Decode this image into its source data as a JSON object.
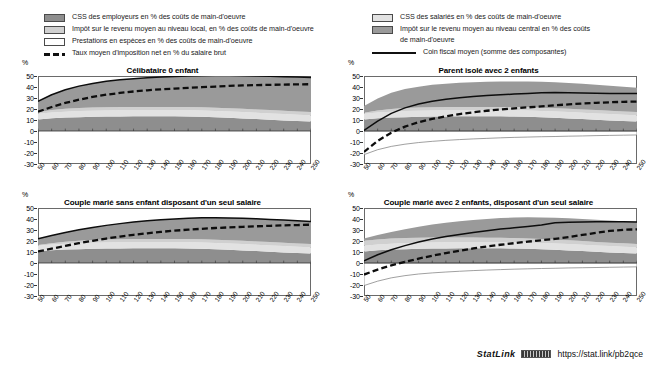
{
  "legend": {
    "left_items": [
      {
        "icon": "swatch-dark-gray",
        "label": "CSS des employeurs en % des coûts de main-d'oeuvre",
        "color": "#8e8e8e"
      },
      {
        "icon": "swatch-light-gray",
        "label": "Impôt sur le revenu moyen au niveau local, en % des coûts de main-d'oeuvre",
        "color": "#d0d0d0"
      },
      {
        "icon": "swatch-white",
        "label": "Prestations en espèces en % des coûts de main-d'oeuvre",
        "color": "#ffffff"
      },
      {
        "icon": "dashed-line-sample",
        "label": "Taux moyen d'imposition net en % du salaire brut",
        "color": "#101010"
      }
    ],
    "right_items": [
      {
        "icon": "swatch-pale-gray",
        "label": "CSS des salariés en % des coûts de main-d'oeuvre",
        "color": "#e2e2e2"
      },
      {
        "icon": "swatch-mid-gray",
        "label": "Impôt sur le revenu moyen au niveau central en %  des coûts",
        "label2": "de main-d'oeuvre",
        "color": "#9a9a9a"
      },
      {
        "icon": "solid-line-sample",
        "label": "Coin fiscal moyen (somme des composantes)",
        "color": "#101010"
      }
    ]
  },
  "axis": {
    "y_unit": "%",
    "y_ticks": [
      "50",
      "40",
      "30",
      "20",
      "10",
      "0",
      "-10",
      "-20",
      "-30"
    ],
    "x_ticks": [
      "50",
      "60",
      "70",
      "80",
      "90",
      "100",
      "110",
      "120",
      "130",
      "140",
      "150",
      "160",
      "170",
      "180",
      "190",
      "200",
      "210",
      "220",
      "230",
      "240",
      "250"
    ]
  },
  "footer": {
    "statlink_word": "StatLink",
    "statlink_url": "https://stat.link/pb2qce"
  },
  "chart_data": [
    {
      "id": "celibataire-0-enfant",
      "type": "area",
      "title": "Célibataire 0 enfant",
      "xlabel": "",
      "ylabel": "%",
      "xlim": [
        50,
        250
      ],
      "ylim": [
        -30,
        50
      ],
      "grid": false,
      "legend_position": "top",
      "x": [
        50,
        60,
        70,
        80,
        90,
        100,
        110,
        120,
        130,
        140,
        150,
        160,
        170,
        180,
        190,
        200,
        210,
        220,
        230,
        240,
        250
      ],
      "series": [
        {
          "name": "CSS des employeurs en % des coûts de main-d'oeuvre",
          "values": [
            10.5,
            11.5,
            12.2,
            12.6,
            12.9,
            13.1,
            13.2,
            13.3,
            13.3,
            13.3,
            13.3,
            13.2,
            13.0,
            12.6,
            12.0,
            11.4,
            10.8,
            10.2,
            9.6,
            9.1,
            8.7
          ]
        },
        {
          "name": "CSS des salariés en % des coûts de main-d'oeuvre",
          "values": [
            5.2,
            5.3,
            5.4,
            5.5,
            5.5,
            5.6,
            5.6,
            5.6,
            5.6,
            5.6,
            5.6,
            5.6,
            5.6,
            5.6,
            5.7,
            5.8,
            5.8,
            5.8,
            5.8,
            5.7,
            5.6
          ]
        },
        {
          "name": "Impôt sur le revenu moyen au niveau local, en % des coûts de main-d'oeuvre",
          "values": [
            1.4,
            2.2,
            2.6,
            2.8,
            2.9,
            3.0,
            3.0,
            3.0,
            3.0,
            3.0,
            3.0,
            3.0,
            3.0,
            3.0,
            3.0,
            3.0,
            3.0,
            3.0,
            3.0,
            3.0,
            3.0
          ]
        },
        {
          "name": "Impôt sur le revenu moyen au niveau central en % des coûts de main-d'oeuvre",
          "values": [
            9.9,
            14.0,
            17.3,
            19.9,
            21.9,
            23.5,
            24.7,
            25.7,
            26.5,
            27.2,
            27.7,
            28.2,
            28.7,
            29.3,
            29.8,
            30.1,
            30.4,
            30.7,
            31.0,
            31.2,
            31.4
          ]
        },
        {
          "name": "Prestations en espèces en % des coûts de main-d'oeuvre",
          "values": [
            0,
            0,
            0,
            0,
            0,
            0,
            0,
            0,
            0,
            0,
            0,
            0,
            0,
            0,
            0,
            0,
            0,
            0,
            0,
            0,
            0
          ]
        }
      ],
      "lines": [
        {
          "name": "Coin fiscal moyen (somme des composantes)",
          "style": "solid",
          "values": [
            27.0,
            33.0,
            37.5,
            40.8,
            43.2,
            45.2,
            46.5,
            47.6,
            48.4,
            49.1,
            49.6,
            50.0,
            50.3,
            50.5,
            50.5,
            50.3,
            50.0,
            49.7,
            49.4,
            49.0,
            48.7
          ]
        },
        {
          "name": "Taux moyen d'imposition net en % du salaire brut",
          "style": "dashed",
          "values": [
            17.5,
            21.8,
            25.5,
            28.5,
            31.0,
            33.0,
            34.6,
            35.9,
            37.0,
            37.9,
            38.6,
            39.2,
            39.8,
            40.4,
            41.0,
            41.4,
            41.7,
            42.0,
            42.2,
            42.4,
            42.5
          ]
        }
      ]
    },
    {
      "id": "parent-isole-2-enfants",
      "type": "area",
      "title": "Parent isolé avec 2 enfants",
      "xlabel": "",
      "ylabel": "%",
      "xlim": [
        50,
        250
      ],
      "ylim": [
        -30,
        50
      ],
      "grid": false,
      "legend_position": "top",
      "x": [
        50,
        60,
        70,
        80,
        90,
        100,
        110,
        120,
        130,
        140,
        150,
        160,
        170,
        180,
        190,
        200,
        210,
        220,
        230,
        240,
        250
      ],
      "series": [
        {
          "name": "CSS des employeurs en % des coûts de main-d'oeuvre",
          "values": [
            10.5,
            11.5,
            12.2,
            12.6,
            12.9,
            13.1,
            13.2,
            13.3,
            13.3,
            13.3,
            13.3,
            13.2,
            13.0,
            12.6,
            12.0,
            11.4,
            10.8,
            10.2,
            9.6,
            9.1,
            8.7
          ]
        },
        {
          "name": "CSS des salariés en % des coûts de main-d'oeuvre",
          "values": [
            5.2,
            5.3,
            5.4,
            5.5,
            5.5,
            5.6,
            5.6,
            5.6,
            5.6,
            5.6,
            5.6,
            5.6,
            5.6,
            5.6,
            5.7,
            5.8,
            5.8,
            5.8,
            5.8,
            5.7,
            5.6
          ]
        },
        {
          "name": "Impôt sur le revenu moyen au niveau local, en % des coûts de main-d'oeuvre",
          "values": [
            1.0,
            1.8,
            2.4,
            2.7,
            2.9,
            3.0,
            3.0,
            3.0,
            3.0,
            3.0,
            3.0,
            3.0,
            3.0,
            3.0,
            3.0,
            3.0,
            3.0,
            3.0,
            3.0,
            3.0,
            3.0
          ]
        },
        {
          "name": "Impôt sur le revenu moyen au niveau central en % des coûts de main-d'oeuvre",
          "values": [
            6.0,
            11.0,
            14.8,
            17.3,
            19.0,
            20.3,
            21.2,
            21.9,
            22.4,
            22.8,
            23.1,
            23.3,
            23.5,
            23.6,
            23.6,
            23.5,
            23.3,
            23.0,
            22.7,
            22.4,
            22.1
          ]
        },
        {
          "name": "Prestations en espèces en % des coûts de main-d'oeuvre",
          "values": [
            -21.5,
            -17.0,
            -14.0,
            -12.0,
            -10.5,
            -9.4,
            -8.5,
            -7.8,
            -7.2,
            -6.7,
            -6.2,
            -5.8,
            -5.5,
            -5.2,
            -5.0,
            -4.7,
            -4.5,
            -4.2,
            -4.0,
            -3.8,
            -3.6
          ]
        }
      ],
      "lines": [
        {
          "name": "Coin fiscal moyen (somme des composantes)",
          "style": "solid",
          "values": [
            0.5,
            9.0,
            16.0,
            21.0,
            24.5,
            27.0,
            28.8,
            30.2,
            31.3,
            32.2,
            32.9,
            33.6,
            34.2,
            34.8,
            35.0,
            34.8,
            34.6,
            34.4,
            34.2,
            34.1,
            34.0
          ]
        },
        {
          "name": "Taux moyen d'imposition net en % du salaire brut",
          "style": "dashed",
          "values": [
            -19.0,
            -9.0,
            -1.5,
            4.0,
            8.0,
            11.0,
            13.4,
            15.4,
            17.0,
            18.4,
            19.6,
            20.6,
            21.5,
            22.4,
            23.4,
            24.2,
            25.0,
            25.6,
            26.1,
            26.5,
            26.8
          ]
        }
      ]
    },
    {
      "id": "couple-marie-sans-enfant-un-seul-salaire",
      "type": "area",
      "title": "Couple marié sans enfant disposant d'un seul salaire",
      "xlabel": "",
      "ylabel": "%",
      "xlim": [
        50,
        250
      ],
      "ylim": [
        -30,
        50
      ],
      "grid": false,
      "legend_position": "top",
      "x": [
        50,
        60,
        70,
        80,
        90,
        100,
        110,
        120,
        130,
        140,
        150,
        160,
        170,
        180,
        190,
        200,
        210,
        220,
        230,
        240,
        250
      ],
      "series": [
        {
          "name": "CSS des employeurs en % des coûts de main-d'oeuvre",
          "values": [
            10.5,
            11.5,
            12.2,
            12.6,
            12.9,
            13.1,
            13.2,
            13.3,
            13.3,
            13.3,
            13.3,
            13.2,
            13.0,
            12.6,
            12.0,
            11.4,
            10.8,
            10.2,
            9.6,
            9.1,
            8.7
          ]
        },
        {
          "name": "CSS des salariés en % des coûts de main-d'oeuvre",
          "values": [
            5.2,
            5.3,
            5.4,
            5.5,
            5.5,
            5.6,
            5.6,
            5.6,
            5.6,
            5.6,
            5.6,
            5.6,
            5.6,
            5.6,
            5.7,
            5.8,
            5.8,
            5.8,
            5.8,
            5.7,
            5.6
          ]
        },
        {
          "name": "Impôt sur le revenu moyen au niveau local, en % des coûts de main-d'oeuvre",
          "values": [
            0.6,
            1.2,
            1.8,
            2.2,
            2.5,
            2.7,
            2.9,
            3.0,
            3.0,
            3.0,
            3.0,
            3.0,
            3.0,
            3.0,
            3.0,
            3.0,
            3.0,
            3.0,
            3.0,
            3.0,
            3.0
          ]
        },
        {
          "name": "Impôt sur le revenu moyen au niveau central en % des coûts de main-d'oeuvre",
          "values": [
            5.7,
            7.0,
            8.4,
            9.9,
            11.4,
            12.8,
            14.1,
            15.3,
            16.4,
            17.4,
            18.2,
            18.9,
            19.5,
            20.0,
            20.3,
            20.5,
            20.6,
            20.6,
            20.6,
            20.5,
            20.4
          ]
        },
        {
          "name": "Prestations en espèces en % des coûts de main-d'oeuvre",
          "values": [
            0,
            0,
            0,
            0,
            0,
            0,
            0,
            0,
            0,
            0,
            0,
            0,
            0,
            0,
            0,
            0,
            0,
            0,
            0,
            0,
            0
          ]
        }
      ],
      "lines": [
        {
          "name": "Coin fiscal moyen (somme des composantes)",
          "style": "solid",
          "values": [
            22.0,
            25.0,
            27.8,
            30.2,
            32.3,
            34.2,
            35.8,
            37.2,
            38.3,
            39.3,
            40.1,
            40.7,
            41.1,
            41.2,
            41.0,
            40.7,
            40.2,
            39.6,
            39.0,
            38.3,
            37.7
          ]
        },
        {
          "name": "Taux moyen d'imposition net en % du salaire brut",
          "style": "dashed",
          "values": [
            10.5,
            13.0,
            15.6,
            18.0,
            20.2,
            22.2,
            24.0,
            25.6,
            27.0,
            28.3,
            29.4,
            30.3,
            31.1,
            31.8,
            32.4,
            32.9,
            33.4,
            33.8,
            34.2,
            34.5,
            34.8
          ]
        }
      ]
    },
    {
      "id": "couple-marie-2-enfants-un-seul-salaire",
      "type": "area",
      "title": "Couple marié avec 2 enfants, disposant d'un seul salaire",
      "xlabel": "",
      "ylabel": "%",
      "xlim": [
        50,
        250
      ],
      "ylim": [
        -30,
        50
      ],
      "grid": false,
      "legend_position": "top",
      "x": [
        50,
        60,
        70,
        80,
        90,
        100,
        110,
        120,
        130,
        140,
        150,
        160,
        170,
        180,
        190,
        200,
        210,
        220,
        230,
        240,
        250
      ],
      "series": [
        {
          "name": "CSS des employeurs en % des coûts de main-d'oeuvre",
          "values": [
            10.5,
            11.5,
            12.2,
            12.6,
            12.9,
            13.1,
            13.2,
            13.3,
            13.3,
            13.3,
            13.3,
            13.2,
            13.0,
            12.6,
            12.0,
            11.4,
            10.8,
            10.2,
            9.6,
            9.1,
            8.7
          ]
        },
        {
          "name": "CSS des salariés en % des coûts de main-d'oeuvre",
          "values": [
            5.2,
            5.3,
            5.4,
            5.5,
            5.5,
            5.6,
            5.6,
            5.6,
            5.6,
            5.6,
            5.6,
            5.6,
            5.6,
            5.6,
            5.7,
            5.8,
            5.8,
            5.8,
            5.8,
            5.7,
            5.6
          ]
        },
        {
          "name": "Impôt sur le revenu moyen au niveau local, en % des coûts de main-d'oeuvre",
          "values": [
            4.5,
            4.6,
            4.6,
            4.6,
            4.6,
            4.5,
            4.4,
            4.3,
            4.2,
            4.1,
            4.0,
            3.9,
            3.7,
            3.6,
            3.5,
            3.4,
            3.3,
            3.2,
            3.1,
            3.1,
            3.0
          ]
        },
        {
          "name": "Impôt sur le revenu moyen au niveau central en % des coûts de main-d'oeuvre",
          "values": [
            2.0,
            4.0,
            6.0,
            8.0,
            10.0,
            11.8,
            13.4,
            14.8,
            16.0,
            17.0,
            17.9,
            18.6,
            19.2,
            19.6,
            19.9,
            20.1,
            20.2,
            20.2,
            20.2,
            20.1,
            20.0
          ]
        },
        {
          "name": "Prestations en espèces en % des coûts de main-d'oeuvre",
          "values": [
            -20.5,
            -16.5,
            -13.5,
            -11.5,
            -10.0,
            -9.0,
            -8.2,
            -7.5,
            -6.9,
            -6.4,
            -6.0,
            -5.6,
            -5.3,
            -5.0,
            -4.8,
            -4.5,
            -4.3,
            -4.1,
            -3.9,
            -3.7,
            -3.5
          ]
        }
      ],
      "lines": [
        {
          "name": "Coin fiscal moyen (somme des composantes)",
          "style": "solid",
          "values": [
            2.0,
            7.5,
            12.0,
            15.8,
            19.0,
            21.8,
            24.0,
            26.0,
            27.8,
            29.4,
            30.8,
            32.0,
            33.2,
            34.5,
            36.5,
            37.0,
            37.3,
            37.5,
            37.6,
            37.5,
            37.3
          ]
        },
        {
          "name": "Taux moyen d'imposition net en % du salaire brut",
          "style": "dashed",
          "values": [
            -10.5,
            -6.0,
            -2.2,
            1.0,
            4.0,
            6.6,
            9.0,
            11.2,
            13.2,
            15.0,
            16.6,
            18.0,
            19.4,
            20.7,
            22.0,
            23.5,
            25.5,
            27.5,
            29.2,
            30.2,
            30.6
          ]
        }
      ]
    }
  ]
}
